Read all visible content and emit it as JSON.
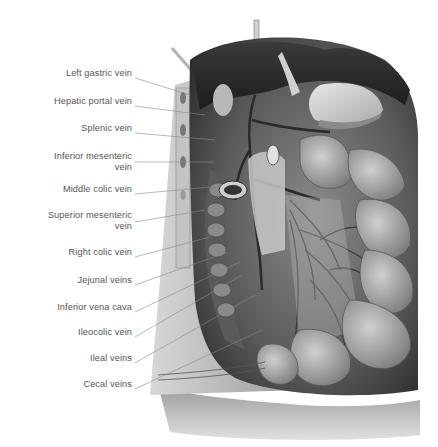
{
  "figure": {
    "style": "grayscale anatomical illustration",
    "colors": {
      "background": "#ffffff",
      "label_text": "#555555",
      "leader_line": "#888888"
    }
  },
  "labels": [
    {
      "text": "Left gastric vein",
      "y": 74,
      "target": [
        190,
        95
      ]
    },
    {
      "text": "Hepatic portal vein",
      "y": 102,
      "target": [
        205,
        115
      ]
    },
    {
      "text": "Splenic vein",
      "y": 129,
      "target": [
        215,
        140
      ]
    },
    {
      "text": "Inferior mesenteric vein",
      "line1": "Inferior mesenteric",
      "line2": "vein",
      "y": 157,
      "target": [
        215,
        162
      ]
    },
    {
      "text": "Middle colic vein",
      "y": 190,
      "target": [
        210,
        187
      ]
    },
    {
      "text": "Superior mesenteric vein",
      "line1": "Superior mesenteric",
      "line2": "vein",
      "y": 218,
      "target": [
        205,
        210
      ]
    },
    {
      "text": "Right colic vein",
      "y": 253,
      "target": [
        210,
        237
      ]
    },
    {
      "text": "Jejunal veins",
      "y": 281,
      "target": [
        228,
        252
      ]
    },
    {
      "text": "Inferior vena cava",
      "y": 308,
      "target": [
        240,
        262
      ]
    },
    {
      "text": "Ileocolic vein",
      "y": 333,
      "target": [
        242,
        275
      ]
    },
    {
      "text": "Ileal veins",
      "y": 359,
      "target": [
        255,
        295
      ]
    },
    {
      "text": "Cecal veins",
      "y": 385,
      "target": [
        262,
        330
      ]
    }
  ]
}
